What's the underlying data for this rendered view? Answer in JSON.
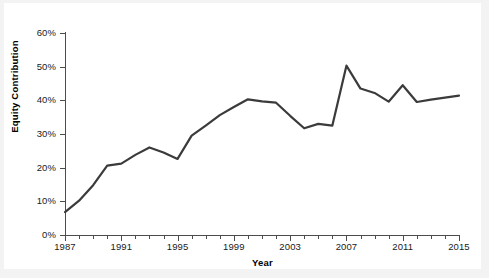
{
  "chart_data": {
    "type": "line",
    "title": "",
    "xlabel": "Year",
    "ylabel": "Equity Contribution",
    "xlim": [
      1987,
      2015
    ],
    "ylim": [
      0,
      0.6
    ],
    "grid": false,
    "legend": null,
    "y_tick_labels": [
      "0%",
      "10%",
      "20%",
      "30%",
      "40%",
      "50%",
      "60%"
    ],
    "y_tick_values": [
      0,
      10,
      20,
      30,
      40,
      50,
      60
    ],
    "x_tick_labels": [
      "1987",
      "1991",
      "1995",
      "1999",
      "2003",
      "2007",
      "2011",
      "2015"
    ],
    "x_major_ticks": [
      1987,
      1991,
      1995,
      1999,
      2003,
      2007,
      2011,
      2015
    ],
    "x_minor_ticks": [
      1988,
      1989,
      1990,
      1992,
      1993,
      1994,
      1996,
      1997,
      1998,
      2000,
      2001,
      2002,
      2004,
      2005,
      2006,
      2008,
      2009,
      2010,
      2012,
      2013,
      2014
    ],
    "line_color": "#3b3b3b",
    "line_width": 2.2,
    "x": [
      1987,
      1988,
      1989,
      1990,
      1991,
      1992,
      1993,
      1994,
      1995,
      1996,
      1997,
      1998,
      1999,
      2000,
      2001,
      2002,
      2003,
      2004,
      2005,
      2006,
      2007,
      2008,
      2009,
      2010,
      2011,
      2012,
      2013,
      2014,
      2015
    ],
    "values": [
      6.8,
      10.2,
      14.8,
      20.6,
      21.2,
      23.8,
      26.0,
      24.5,
      22.6,
      29.5,
      32.5,
      35.6,
      38.0,
      40.3,
      39.7,
      39.3,
      35.4,
      31.7,
      33.0,
      32.5,
      50.3,
      43.5,
      42.2,
      39.6,
      44.5,
      39.5,
      40.2,
      40.8,
      41.4
    ],
    "series": [
      {
        "name": "Equity Contribution",
        "values": [
          6.8,
          10.2,
          14.8,
          20.6,
          21.2,
          23.8,
          26.0,
          24.5,
          22.6,
          29.5,
          32.5,
          35.6,
          38.0,
          40.3,
          39.7,
          39.3,
          35.4,
          31.7,
          33.0,
          32.5,
          50.3,
          43.5,
          42.2,
          39.6,
          44.5,
          39.5,
          40.2,
          40.8,
          41.4
        ]
      }
    ],
    "units": "percent"
  }
}
